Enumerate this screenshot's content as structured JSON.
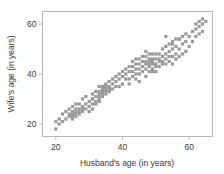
{
  "chart_data": {
    "type": "scatter",
    "title": "",
    "subtitle": "",
    "xlabel": "Husband's age (in years)",
    "ylabel": "Wife's age (in years)",
    "xlim": [
      16,
      67
    ],
    "ylim": [
      15,
      65
    ],
    "xticks": [
      20,
      40,
      60
    ],
    "yticks": [
      20,
      40,
      60
    ],
    "xticklabels": [
      "20",
      "40",
      "60"
    ],
    "yticklabels": [
      "20",
      "40",
      "60"
    ],
    "grid": false,
    "legend": null,
    "legend_position": "none",
    "annotations": [],
    "series": [
      {
        "name": "couples",
        "marker": "square",
        "marker_color": "#9a9a9a",
        "marker_size": 1.6,
        "x": [
          20,
          20,
          21,
          21,
          22,
          22,
          23,
          23,
          24,
          24,
          24,
          25,
          25,
          25,
          25,
          26,
          26,
          26,
          26,
          26,
          27,
          27,
          27,
          27,
          28,
          28,
          28,
          28,
          29,
          29,
          29,
          30,
          30,
          30,
          31,
          31,
          31,
          31,
          32,
          32,
          32,
          32,
          33,
          33,
          33,
          33,
          33,
          34,
          34,
          34,
          34,
          34,
          35,
          35,
          35,
          35,
          35,
          35,
          36,
          36,
          36,
          36,
          37,
          37,
          37,
          38,
          38,
          38,
          39,
          39,
          39,
          40,
          40,
          40,
          41,
          41,
          41,
          42,
          42,
          42,
          43,
          43,
          43,
          43,
          44,
          44,
          44,
          44,
          44,
          45,
          45,
          45,
          45,
          46,
          46,
          46,
          46,
          47,
          47,
          47,
          47,
          47,
          48,
          48,
          48,
          48,
          48,
          48,
          49,
          49,
          49,
          49,
          49,
          50,
          50,
          50,
          50,
          50,
          51,
          51,
          51,
          51,
          52,
          52,
          52,
          52,
          53,
          53,
          53,
          53,
          54,
          54,
          54,
          54,
          55,
          55,
          55,
          55,
          56,
          56,
          56,
          56,
          57,
          57,
          57,
          58,
          58,
          58,
          59,
          59,
          59,
          60,
          60,
          61,
          61,
          62,
          62,
          62,
          63,
          63,
          63,
          64,
          64,
          64,
          65,
          53,
          55,
          57,
          47,
          49,
          33,
          36,
          42,
          45,
          25,
          28,
          31
        ],
        "y": [
          18,
          21,
          20,
          22,
          21,
          24,
          22,
          25,
          23,
          24,
          26,
          23,
          24,
          25,
          27,
          23,
          24,
          25,
          26,
          28,
          24,
          25,
          26,
          28,
          25,
          26,
          27,
          30,
          26,
          28,
          31,
          25,
          27,
          29,
          28,
          30,
          32,
          26,
          29,
          31,
          33,
          28,
          30,
          31,
          32,
          33,
          35,
          31,
          32,
          33,
          34,
          35,
          32,
          33,
          34,
          35,
          35,
          36,
          33,
          34,
          35,
          37,
          34,
          36,
          38,
          35,
          37,
          39,
          35,
          38,
          40,
          36,
          39,
          41,
          38,
          40,
          42,
          38,
          41,
          43,
          39,
          41,
          43,
          45,
          38,
          40,
          42,
          44,
          46,
          40,
          42,
          44,
          46,
          41,
          43,
          45,
          47,
          42,
          44,
          45,
          47,
          49,
          41,
          43,
          44,
          45,
          46,
          48,
          42,
          44,
          45,
          46,
          48,
          41,
          43,
          44,
          46,
          48,
          43,
          45,
          46,
          48,
          44,
          45,
          47,
          50,
          44,
          46,
          48,
          51,
          45,
          47,
          49,
          52,
          44,
          47,
          50,
          53,
          46,
          48,
          51,
          54,
          47,
          50,
          54,
          48,
          52,
          55,
          49,
          53,
          56,
          51,
          55,
          53,
          57,
          55,
          58,
          60,
          56,
          59,
          61,
          57,
          60,
          62,
          61,
          55,
          52,
          54,
          39,
          41,
          29,
          34,
          36,
          37,
          22,
          27,
          30
        ]
      }
    ]
  }
}
